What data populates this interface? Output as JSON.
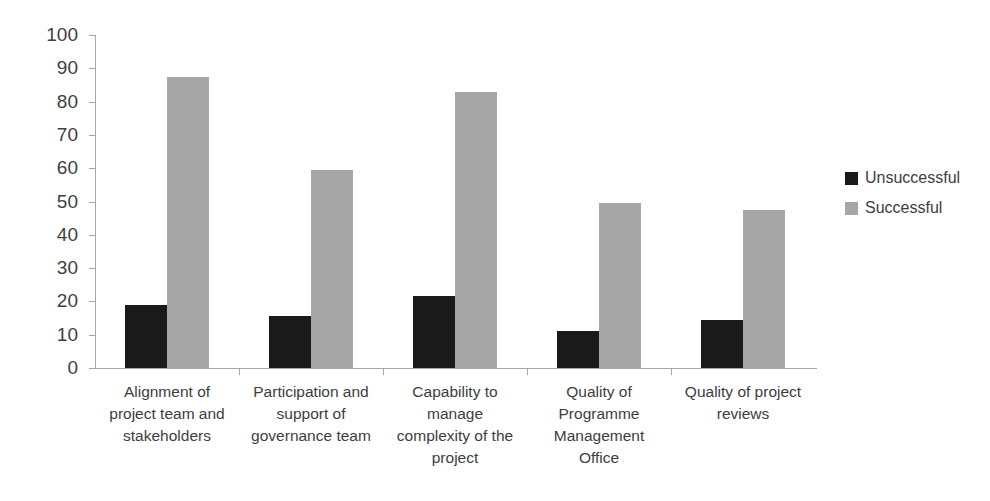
{
  "chart_data": {
    "type": "bar",
    "title": "",
    "subtitle": "",
    "xlabel": "",
    "ylabel": "",
    "ylim": [
      0,
      100
    ],
    "grid": false,
    "legend_position": "right",
    "categories": [
      "Alignment of\nproject team and\nstakeholders",
      "Participation and\nsupport of\ngovernance team",
      "Capability to\nmanage\ncomplexity of the\nproject",
      "Quality of\nProgramme\nManagement\nOffice",
      "Quality of project\nreviews"
    ],
    "yticks": [
      0,
      10,
      20,
      30,
      40,
      50,
      60,
      70,
      80,
      90,
      100
    ],
    "series": [
      {
        "name": "Unsuccessful",
        "color": "#1a1a1a",
        "values": [
          19,
          15.5,
          21.5,
          11,
          14.5
        ]
      },
      {
        "name": "Successful",
        "color": "#a6a6a6",
        "values": [
          87.5,
          59.5,
          83,
          49.5,
          47.5
        ]
      }
    ]
  },
  "legend": {
    "items": [
      {
        "label": "Unsuccessful",
        "swatch": "unsuccessful"
      },
      {
        "label": "Successful",
        "swatch": "successful"
      }
    ]
  },
  "colors": {
    "background": "#ffffff",
    "axis": "#a6a6a6",
    "text": "#404040",
    "series_unsuccessful": "#1a1a1a",
    "series_successful": "#a6a6a6"
  }
}
